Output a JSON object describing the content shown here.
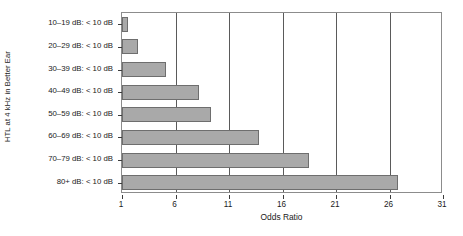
{
  "chart_data": {
    "type": "bar",
    "orientation": "horizontal",
    "title": "",
    "xlabel": "Odds Ratio",
    "ylabel": "HTL at 4 kHz in Better Ear",
    "categories": [
      "10–19 dB: < 10 dB",
      "20–29 dB: < 10 dB",
      "30–39 dB: < 10 dB",
      "40–49 dB: < 10 dB",
      "50–59 dB: < 10 dB",
      "60–69 dB: < 10 dB",
      "70–79 dB: < 10 dB",
      "80+ dB: < 10 dB"
    ],
    "values": [
      1.6,
      2.5,
      5.1,
      8.2,
      9.3,
      13.8,
      18.5,
      26.8
    ],
    "xlim": [
      1,
      31
    ],
    "xticks": [
      1,
      6,
      11,
      16,
      21,
      26,
      31
    ],
    "xticklabels": [
      "1",
      "6",
      "11",
      "16",
      "21",
      "26",
      "31"
    ],
    "gridlines_at": [
      6,
      11,
      16,
      21,
      26
    ],
    "grid": true,
    "legend": "none",
    "bar_color": "#a9a9a9",
    "bar_border_color": "#6e6e6e",
    "axis_color": "#8c8c8c",
    "grid_color": "#5a5a5a",
    "background": "#ffffff"
  }
}
